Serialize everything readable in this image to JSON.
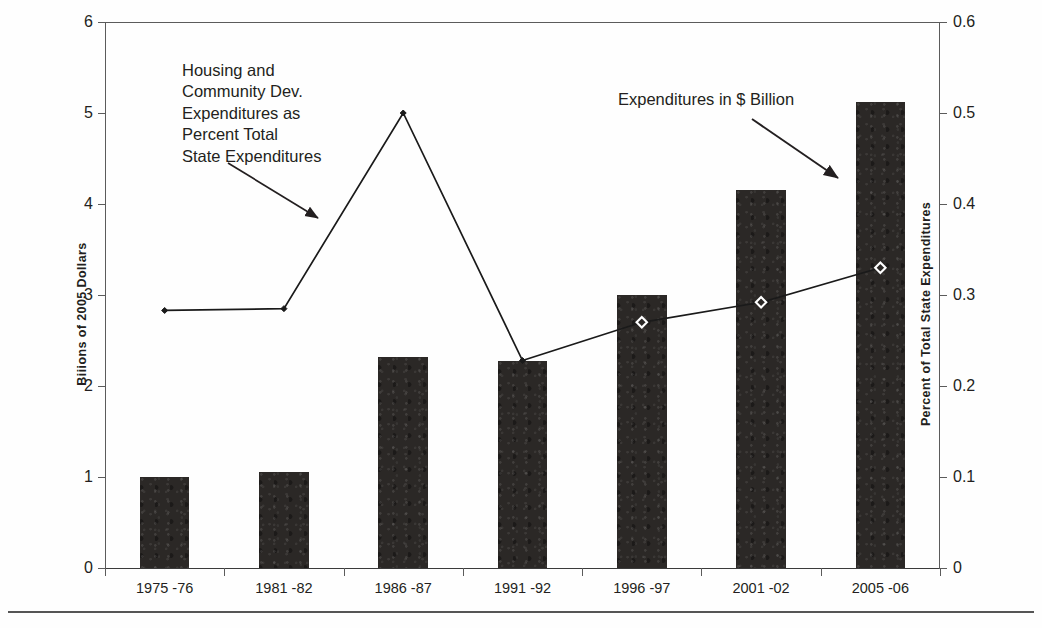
{
  "chart_data": {
    "type": "bar",
    "title": "",
    "categories": [
      "1975 -76",
      "1981 -82",
      "1986 -87",
      "1991 -92",
      "1996 -97",
      "2001 -02",
      "2005 -06"
    ],
    "series": [
      {
        "name": "Expenditures in $ Billion",
        "type": "bar",
        "axis": "left",
        "values": [
          1.0,
          1.05,
          2.32,
          2.28,
          3.0,
          4.15,
          5.12
        ]
      },
      {
        "name": "Housing and Community Dev. Expenditures as Percent Total State Expenditures",
        "type": "line",
        "axis": "right",
        "values": [
          0.283,
          0.285,
          0.5,
          0.228,
          0.27,
          0.292,
          0.33
        ]
      }
    ],
    "xlabel": "",
    "ylabel": "Biiions of 2005 Dollars",
    "y2label": "Percent of Total State Expenditures",
    "ylim": [
      0,
      6
    ],
    "y2lim": [
      0,
      0.6
    ],
    "yticks": [
      "0",
      "1",
      "2",
      "3",
      "4",
      "5",
      "6"
    ],
    "y2ticks": [
      "0",
      "0.1",
      "0.2",
      "0.3",
      "0.4",
      "0.5",
      "0.6"
    ],
    "grid": false,
    "legend": "none",
    "colors": {
      "bar": "#2b2826",
      "line": "#1a1a1a",
      "marker_fill": "#ffffff",
      "text": "#231f20",
      "axis": "#5b5b5b",
      "background": "#ffffff"
    },
    "annotations": [
      {
        "id": "percent-series-callout",
        "text": "Housing and\nCommunity Dev.\nExpenditures as\nPercent Total\nState Expenditures",
        "arrow_to": "line-series"
      },
      {
        "id": "dollar-series-callout",
        "text": "Expenditures in $ Billion",
        "arrow_to": "last-bar"
      }
    ]
  }
}
